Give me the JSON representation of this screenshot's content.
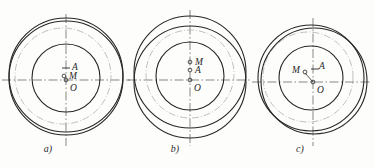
{
  "document": {
    "kind": "engineering-drawing",
    "description": "Three-part technical figure of eccentric circles with marked centers",
    "background_color": "#fdfdfc",
    "line_color": "#262626",
    "centerline_color": "#555555",
    "phantom_color": "#9a9a9a"
  },
  "figures": [
    {
      "id": "a",
      "caption": "a)",
      "caption_x": 48,
      "caption_y": 149,
      "center": {
        "x": 66,
        "y": 80
      },
      "circles": [
        {
          "name": "outer-circle-1",
          "cx": 66,
          "cy": 78,
          "r": 57
        },
        {
          "name": "outer-circle-2",
          "cx": 66,
          "cy": 75,
          "r": 57
        },
        {
          "name": "inner-circle",
          "cx": 66,
          "cy": 78,
          "r": 34
        }
      ],
      "phantom_circle": {
        "cx": 63,
        "cy": 76,
        "r": 48
      },
      "axes": {
        "horizontal": {
          "x1": 2,
          "y1": 80,
          "x2": 130,
          "y2": 80
        },
        "vertical": {
          "x1": 66,
          "y1": 14,
          "x2": 66,
          "y2": 146
        }
      },
      "points": [
        {
          "label": "A",
          "x": 66,
          "y": 68,
          "label_dx": 6,
          "label_dy": 2,
          "marker": "tick"
        },
        {
          "label": "M",
          "x": 64,
          "y": 76,
          "label_dx": 5,
          "label_dy": 3,
          "marker": "circle"
        },
        {
          "label": "O",
          "x": 66,
          "y": 80,
          "label_dx": 4,
          "label_dy": 11,
          "marker": "circle"
        }
      ]
    },
    {
      "id": "b",
      "caption": "b)",
      "caption_x": 175,
      "caption_y": 149,
      "center": {
        "x": 190,
        "y": 80
      },
      "circles": [
        {
          "name": "outer-circle-1",
          "cx": 190,
          "cy": 72,
          "r": 56
        },
        {
          "name": "outer-circle-2",
          "cx": 190,
          "cy": 82,
          "r": 56
        },
        {
          "name": "inner-circle",
          "cx": 190,
          "cy": 76,
          "r": 34
        }
      ],
      "phantom_circle": {
        "cx": 190,
        "cy": 74,
        "r": 44
      },
      "axes": {
        "horizontal": {
          "x1": 128,
          "y1": 80,
          "x2": 252,
          "y2": 80
        },
        "vertical": {
          "x1": 190,
          "y1": 10,
          "x2": 190,
          "y2": 146
        }
      },
      "points": [
        {
          "label": "M",
          "x": 190,
          "y": 62,
          "label_dx": 5,
          "label_dy": 3,
          "marker": "circle"
        },
        {
          "label": "A",
          "x": 190,
          "y": 70,
          "label_dx": 5,
          "label_dy": 3,
          "marker": "circle"
        },
        {
          "label": "O",
          "x": 190,
          "y": 80,
          "label_dx": 4,
          "label_dy": 11,
          "marker": "circle"
        }
      ]
    },
    {
      "id": "c",
      "caption": "c)",
      "caption_x": 300,
      "caption_y": 149,
      "center": {
        "x": 313,
        "y": 82
      },
      "circles": [
        {
          "name": "outer-circle-1",
          "cx": 311,
          "cy": 78,
          "r": 53
        },
        {
          "name": "outer-circle-2",
          "cx": 314,
          "cy": 81,
          "r": 53
        },
        {
          "name": "inner-circle",
          "cx": 311,
          "cy": 78,
          "r": 32
        }
      ],
      "phantom_circle": {
        "cx": 308,
        "cy": 77,
        "r": 45
      },
      "axes": {
        "horizontal": {
          "x1": 252,
          "y1": 82,
          "x2": 372,
          "y2": 82
        },
        "vertical": {
          "x1": 313,
          "y1": 18,
          "x2": 313,
          "y2": 146
        }
      },
      "points": [
        {
          "label": "M",
          "x": 305,
          "y": 72,
          "label_dx": -11,
          "label_dy": 1,
          "marker": "circle"
        },
        {
          "label": "A",
          "x": 316,
          "y": 69,
          "label_dx": 3,
          "label_dy": -1,
          "marker": "tick"
        },
        {
          "label": "O",
          "x": 313,
          "y": 82,
          "label_dx": 4,
          "label_dy": 11,
          "marker": "circle"
        }
      ],
      "connector": {
        "x1": 305,
        "y1": 73,
        "x2": 313,
        "y2": 82
      }
    }
  ]
}
